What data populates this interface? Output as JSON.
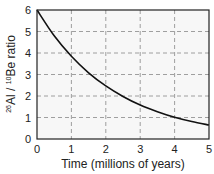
{
  "chart_data": {
    "type": "line",
    "title": "",
    "xlabel": "Time (millions of years)",
    "ylabel": "26Al / 10Be ratio",
    "ylabel_parts": {
      "sup1": "26",
      "el1": "Al / ",
      "sup2": "10",
      "el2": "Be ratio"
    },
    "xlim": [
      0,
      5
    ],
    "ylim": [
      0,
      6
    ],
    "xticks": [
      "0",
      "1",
      "2",
      "3",
      "4",
      "5"
    ],
    "yticks": [
      "0",
      "1",
      "2",
      "3",
      "4",
      "5",
      "6"
    ],
    "grid": true,
    "legend": null,
    "series": [
      {
        "name": "26Al/10Be ratio",
        "color": "#111111",
        "x": [
          0,
          0.5,
          1,
          1.5,
          2,
          2.5,
          3,
          3.5,
          4,
          4.5,
          5
        ],
        "values": [
          6.0,
          4.8,
          3.85,
          3.08,
          2.47,
          1.98,
          1.58,
          1.27,
          1.01,
          0.81,
          0.65
        ]
      }
    ]
  },
  "colors": {
    "plot_background": "#f7f7f7",
    "axis": "#222222",
    "grid": "#888888",
    "line": "#111111"
  }
}
